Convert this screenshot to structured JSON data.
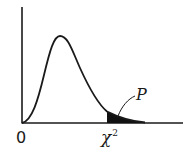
{
  "diagram": {
    "type": "chi-square distribution density curve with shaded right tail",
    "labels": {
      "origin": "0",
      "critical_value": "χ",
      "critical_value_superscript": "2",
      "tail_area": "P"
    },
    "colors": {
      "stroke": "#1a1a1a",
      "fill": "#111111",
      "background": "#ffffff"
    }
  }
}
